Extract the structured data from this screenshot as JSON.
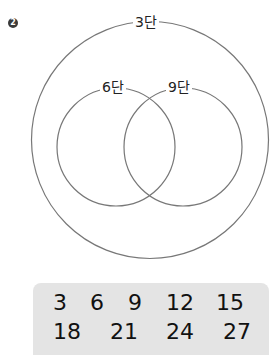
{
  "problem": {
    "number": "2"
  },
  "venn": {
    "outer_label": "3단",
    "left_label": "6단",
    "right_label": "9단",
    "stroke_color": "#777777"
  },
  "numbers_box": {
    "row1": [
      "3",
      "6",
      "9",
      "12",
      "15"
    ],
    "row2": [
      "18",
      "21",
      "24",
      "27"
    ],
    "background": "#e4e4e4"
  }
}
